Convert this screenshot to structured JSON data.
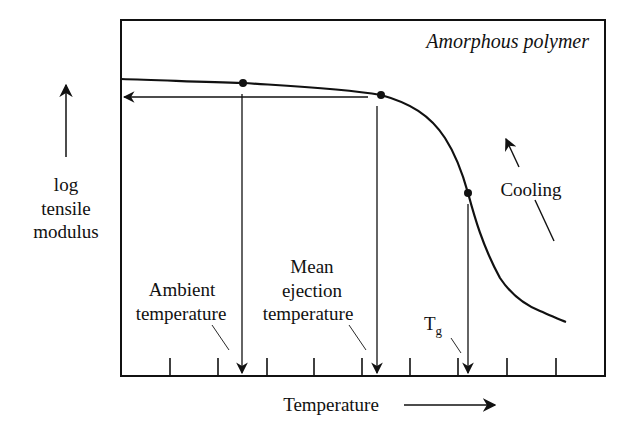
{
  "diagram": {
    "title": "Amorphous polymer",
    "y_axis_label": [
      "log",
      "tensile",
      "modulus"
    ],
    "x_axis_label": "Temperature",
    "annotations": {
      "ambient": [
        "Ambient",
        "temperature"
      ],
      "ejection": [
        "Mean",
        "ejection",
        "temperature"
      ],
      "tg_main": "T",
      "tg_sub": "g",
      "cooling": "Cooling"
    },
    "markers": [
      {
        "name": "ambient-temperature-point",
        "x": 243,
        "y": 83
      },
      {
        "name": "mean-ejection-temperature-point",
        "x": 381,
        "y": 95
      },
      {
        "name": "glass-transition-point",
        "x": 468,
        "y": 193
      }
    ],
    "tick_count": 9,
    "colors": {
      "ink": "#111111",
      "background": "#ffffff"
    }
  }
}
